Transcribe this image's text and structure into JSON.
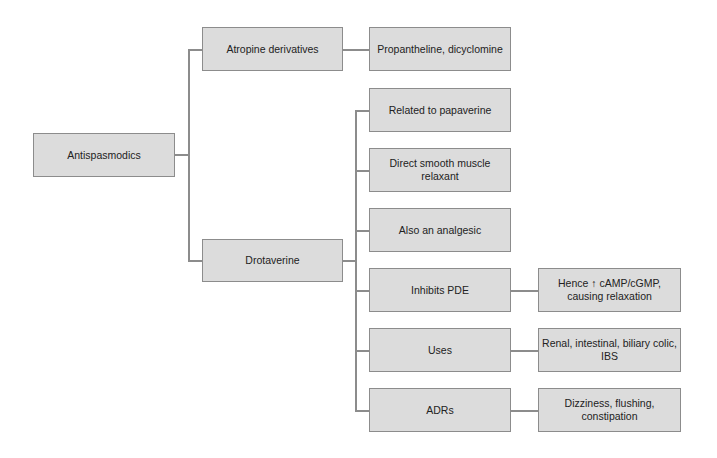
{
  "diagram": {
    "type": "tree",
    "colors": {
      "box_fill": "#dcdcdc",
      "box_border": "#8c8c8c",
      "connector": "#8c8c8c",
      "text": "#222222"
    },
    "root": {
      "label": "Antispasmodics"
    },
    "level1": [
      {
        "label": "Atropine derivatives",
        "children": [
          {
            "label": "Propantheline, dicyclomine"
          }
        ]
      },
      {
        "label": "Drotaverine",
        "children": [
          {
            "label": "Related to papaverine"
          },
          {
            "label": "Direct smooth muscle relaxant"
          },
          {
            "label": "Also an analgesic"
          },
          {
            "label": "Inhibits PDE",
            "detail": "Hence ↑ cAMP/cGMP, causing relaxation"
          },
          {
            "label": "Uses",
            "detail": "Renal, intestinal, biliary colic, IBS"
          },
          {
            "label": "ADRs",
            "detail": "Dizziness, flushing, constipation"
          }
        ]
      }
    ]
  }
}
